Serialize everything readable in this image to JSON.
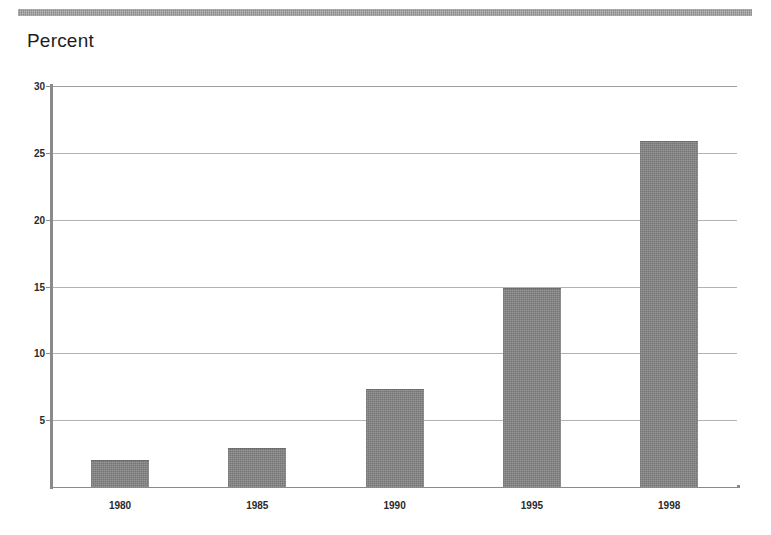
{
  "figure": {
    "axis_title": "Percent",
    "top_rule_color": "#8d8d8d",
    "bar_color": "#7e7e7e",
    "gridline_color": "#b3b3b3",
    "axis_color": "#8a8a8a"
  },
  "chart_data": {
    "type": "bar",
    "title": "",
    "subtitle": "",
    "xlabel": "",
    "ylabel": "Percent",
    "categories": [
      "1980",
      "1985",
      "1990",
      "1995",
      "1998"
    ],
    "values": [
      2.0,
      2.9,
      7.3,
      14.9,
      25.9
    ],
    "ylim": [
      0,
      30
    ],
    "ytick_labels": [
      "30",
      "25",
      "20",
      "15",
      "10",
      "5"
    ],
    "ytick_values": [
      30,
      25,
      20,
      15,
      10,
      5
    ],
    "grid": true,
    "grid_axis": "y",
    "legend": "none",
    "annotations": []
  }
}
